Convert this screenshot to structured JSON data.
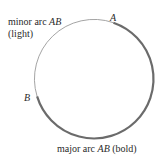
{
  "diagram": {
    "type": "circle-arcs",
    "circle": {
      "cx": 94,
      "cy": 79,
      "r": 59.5
    },
    "points": [
      {
        "name": "A",
        "label": "A"
      },
      {
        "name": "B",
        "label": "B"
      }
    ],
    "labels": {
      "minor_line1_prefix": "minor arc ",
      "minor_line1_var": "AB",
      "minor_line2": "(light)",
      "major_prefix": "major arc ",
      "major_var": "AB",
      "major_suffix": " (bold)",
      "point_a": "A",
      "point_b": "B"
    },
    "colors": {
      "minor_arc": "#9a9a9a",
      "major_arc": "#6b6b6b",
      "text": "#2a2a2a"
    }
  }
}
